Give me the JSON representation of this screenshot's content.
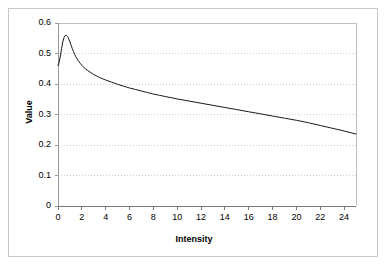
{
  "chart_data": {
    "type": "line",
    "title": "",
    "xlabel": "Intensity",
    "ylabel": "Value",
    "xlim": [
      0,
      25
    ],
    "ylim": [
      0,
      0.6
    ],
    "grid": "horizontal-dotted",
    "legend": "none",
    "xticks": [
      0,
      2,
      4,
      6,
      8,
      10,
      12,
      14,
      16,
      18,
      20,
      22,
      24
    ],
    "xtick_labels": [
      "0",
      "2",
      "4",
      "6",
      "8",
      "10",
      "12",
      "14",
      "16",
      "18",
      "20",
      "22",
      "24"
    ],
    "yticks": [
      0,
      0.1,
      0.2,
      0.3,
      0.4,
      0.5,
      0.6
    ],
    "ytick_labels": [
      "0",
      "0.1",
      "0.2",
      "0.3",
      "0.4",
      "0.5",
      "0.6"
    ],
    "series": [
      {
        "name": "value-curve",
        "color": "#1a1a1a",
        "x": [
          0,
          0.1,
          0.2,
          0.3,
          0.4,
          0.5,
          0.6,
          0.7,
          0.8,
          0.9,
          1.0,
          1.1,
          1.2,
          1.3,
          1.4,
          1.5,
          1.7,
          1.9,
          2.1,
          2.3,
          2.5,
          3.0,
          3.5,
          4.0,
          4.5,
          5.0,
          5.5,
          6.0,
          6.5,
          7.0,
          7.5,
          8.0,
          8.5,
          9.0,
          9.5,
          10.0,
          11.0,
          12.0,
          13.0,
          14.0,
          15.0,
          16.0,
          17.0,
          18.0,
          19.0,
          20.0,
          21.0,
          22.0,
          23.0,
          24.0,
          25.0
        ],
        "y": [
          0.46,
          0.472,
          0.492,
          0.516,
          0.538,
          0.552,
          0.559,
          0.56,
          0.556,
          0.548,
          0.538,
          0.527,
          0.516,
          0.506,
          0.497,
          0.489,
          0.476,
          0.466,
          0.457,
          0.45,
          0.444,
          0.431,
          0.421,
          0.413,
          0.406,
          0.399,
          0.393,
          0.387,
          0.382,
          0.377,
          0.372,
          0.367,
          0.363,
          0.359,
          0.355,
          0.351,
          0.344,
          0.337,
          0.33,
          0.323,
          0.316,
          0.309,
          0.302,
          0.295,
          0.288,
          0.281,
          0.273,
          0.264,
          0.255,
          0.246,
          0.236
        ]
      }
    ]
  },
  "caption": {
    "text": ""
  }
}
